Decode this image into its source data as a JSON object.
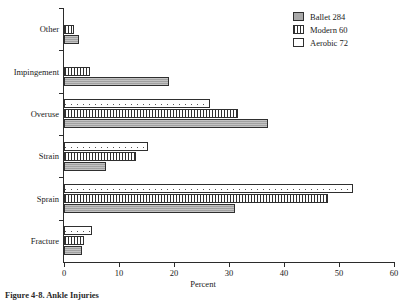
{
  "chart_data": {
    "type": "bar",
    "orientation": "horizontal",
    "title": "",
    "xlabel": "Percent",
    "ylabel": "",
    "xlim": [
      0,
      60
    ],
    "xticks": [
      0,
      10,
      20,
      30,
      40,
      50,
      60
    ],
    "grid": false,
    "legend_position": "top-right",
    "categories": [
      "Fracture",
      "Sprain",
      "Strain",
      "Overuse",
      "Impingement",
      "Other"
    ],
    "series": [
      {
        "name": "Ballet 284",
        "label": "Ballet 284",
        "key": "ballet",
        "values": [
          3.3,
          31.0,
          7.6,
          37.0,
          19.0,
          2.7
        ]
      },
      {
        "name": "Modern 60",
        "label": "Modern 60",
        "key": "modern",
        "values": [
          3.6,
          48.0,
          13.0,
          31.6,
          4.7,
          1.8
        ]
      },
      {
        "name": "Aerobic 72",
        "label": "Aerobic 72",
        "key": "aerobic",
        "values": [
          5.0,
          52.5,
          15.3,
          26.5,
          0.0,
          0.0
        ]
      }
    ]
  },
  "legend": {
    "items": [
      {
        "label": "Ballet 284",
        "swatch": "solid-gray-swatch"
      },
      {
        "label": "Modern 60",
        "swatch": "vertical-hatch-swatch"
      },
      {
        "label": "Aerobic 72",
        "swatch": "dotted-swatch"
      }
    ]
  },
  "axes": {
    "x_title": "Percent",
    "x_tick_labels": [
      "0",
      "10",
      "20",
      "30",
      "40",
      "50",
      "60"
    ],
    "y_tick_labels": [
      "Fracture",
      "Sprain",
      "Strain",
      "Overuse",
      "Impingement",
      "Other"
    ]
  },
  "caption": {
    "text": "Figure 4-8. Ankle Injuries"
  },
  "colors": {
    "ballet_fill": "#a9a9a9",
    "modern_fill": "#ffffff",
    "aerobic_fill": "#ffffff",
    "bar_outline": "#2f2f2f",
    "axis": "#2b2b2b",
    "text": "#1a1a1a",
    "background": "#ffffff"
  }
}
